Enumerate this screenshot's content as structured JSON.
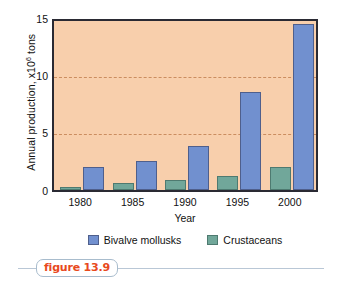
{
  "chart_data": {
    "type": "bar",
    "title": "",
    "subtitle": "",
    "xlabel": "Year",
    "ylabel": "Annual production, x10⁶ tons",
    "ylabel_base": "Annual production, x10",
    "ylabel_exponent": "6",
    "ylabel_tail": " tons",
    "categories": [
      "1980",
      "1985",
      "1990",
      "1995",
      "2000"
    ],
    "series": [
      {
        "name": "Bivalve mollusks",
        "color": "#7190cf",
        "values": [
          2.0,
          2.6,
          3.9,
          8.7,
          14.7
        ]
      },
      {
        "name": "Crustaceans",
        "color": "#71a79a",
        "values": [
          0.25,
          0.6,
          0.85,
          1.2,
          2.0
        ]
      }
    ],
    "ylim": [
      0,
      15
    ],
    "yticks": [
      0,
      5,
      10,
      15
    ],
    "ytick_labels": [
      "0",
      "5",
      "10",
      "15"
    ],
    "gridlines": [
      5,
      10
    ],
    "grid": true,
    "grid_style": "dashed",
    "grid_color": "#c98a5c",
    "legend_position": "bottom-center",
    "plot_background": "#f8cfac",
    "axis_color": "#2a2a33"
  },
  "legend": {
    "items": [
      {
        "label": "Bivalve mollusks",
        "swatch": "blue"
      },
      {
        "label": "Crustaceans",
        "swatch": "teal"
      }
    ]
  },
  "caption": {
    "text": "figure 13.9",
    "color": "#e8491d"
  }
}
